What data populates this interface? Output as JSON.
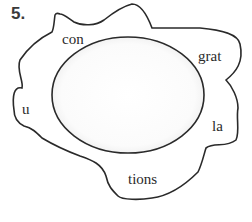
{
  "exercise": {
    "number": "5.",
    "syllables": [
      {
        "id": "con",
        "text": "con"
      },
      {
        "id": "grat",
        "text": "grat"
      },
      {
        "id": "u",
        "text": "u"
      },
      {
        "id": "la",
        "text": "la"
      },
      {
        "id": "tions",
        "text": "tions"
      }
    ],
    "answer_area": "empty-ellipse"
  },
  "colors": {
    "outline": "#2a2a2a",
    "text": "#2a2a2a",
    "number": "#3a3a3a",
    "background": "#ffffff"
  }
}
